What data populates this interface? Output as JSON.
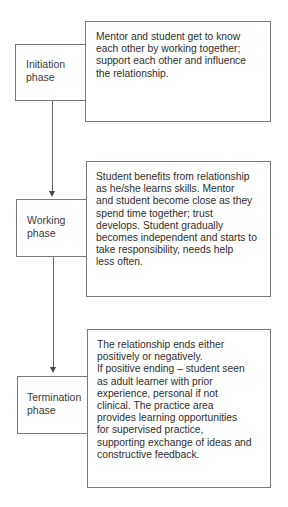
{
  "diagram": {
    "type": "flowchart",
    "direction": "top-to-bottom",
    "phases": [
      {
        "label": "Initiation\nphase",
        "description": "Mentor and student get to know\neach other by working together;\nsupport each other and influence\nthe relationship."
      },
      {
        "label": "Working\nphase",
        "description": "Student benefits from relationship\nas he/she learns skills. Mentor\nand student become close as they\nspend time together; trust\ndevelops. Student gradually\nbecomes independent and starts to\ntake responsibility, needs help\nless often."
      },
      {
        "label": "Termination\nphase",
        "description": "The relationship ends either\npositively or negatively.\nIf positive ending – student seen\nas adult learner with prior\nexperience, personal if not\nclinical. The practice area\nprovides learning opportunities\nfor supervised practice,\nsupporting exchange of ideas and\nconstructive feedback."
      }
    ],
    "connectors": [
      {
        "from": "Initiation phase",
        "to": "Working phase",
        "style": "arrow-down"
      },
      {
        "from": "Working phase",
        "to": "Termination phase",
        "style": "arrow-down"
      }
    ],
    "colors": {
      "border": "#7a7a7a",
      "text": "#2e2e2e",
      "arrow": "#444444",
      "background": "#ffffff"
    }
  }
}
